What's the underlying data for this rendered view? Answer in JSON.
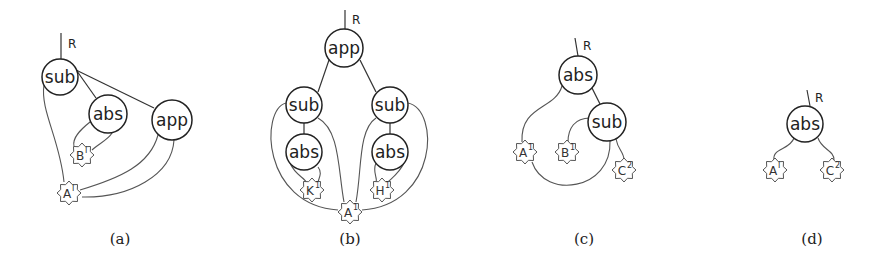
{
  "figure": {
    "captions": [
      "(a)",
      "(b)",
      "(c)",
      "(d)"
    ],
    "caption_x": [
      120,
      350,
      584,
      812
    ],
    "root_label": "R",
    "panels": [
      {
        "id": "a",
        "root": {
          "x1": 61,
          "y1": 33,
          "x2": 61,
          "y2": 59,
          "label_x": 68,
          "label_y": 48
        },
        "nodes": [
          {
            "id": "sub",
            "label": "sub",
            "x": 60,
            "y": 77,
            "r": 18
          },
          {
            "id": "abs",
            "label": "abs",
            "x": 108,
            "y": 114,
            "r": 19
          },
          {
            "id": "app",
            "label": "app",
            "x": 172,
            "y": 120,
            "r": 20
          }
        ],
        "stars": [
          {
            "id": "B",
            "label": "B",
            "sup": "I",
            "x": 82,
            "y": 155
          },
          {
            "id": "A",
            "label": "A",
            "sup": "I",
            "x": 69,
            "y": 193
          }
        ],
        "edges": [
          {
            "d": "M72 64 L96 98"
          },
          {
            "d": "M76 70 L154 108"
          }
        ],
        "wires": [
          {
            "d": "M44 85 C40 110, 60 140, 64 182"
          },
          {
            "d": "M90 122 C80 130, 72 138, 74 146"
          },
          {
            "d": "M112 133 C108 140, 98 144, 92 150"
          },
          {
            "d": "M158 135 C150 165, 120 178, 80 190"
          },
          {
            "d": "M174 140 C172 175, 130 198, 82 197"
          }
        ]
      },
      {
        "id": "b",
        "root": {
          "x1": 345,
          "y1": 10,
          "x2": 345,
          "y2": 30,
          "label_x": 352,
          "label_y": 24
        },
        "nodes": [
          {
            "id": "app",
            "label": "app",
            "x": 344,
            "y": 48,
            "r": 19
          },
          {
            "id": "sub-left",
            "label": "sub",
            "x": 304,
            "y": 105,
            "r": 18
          },
          {
            "id": "sub-right",
            "label": "sub",
            "x": 390,
            "y": 105,
            "r": 18
          },
          {
            "id": "abs-left",
            "label": "abs",
            "x": 304,
            "y": 152,
            "r": 18
          },
          {
            "id": "abs-right",
            "label": "abs",
            "x": 390,
            "y": 152,
            "r": 18
          }
        ],
        "stars": [
          {
            "id": "K",
            "label": "K",
            "sup": "1",
            "x": 312,
            "y": 190
          },
          {
            "id": "H",
            "label": "H",
            "sup": "1",
            "x": 382,
            "y": 190
          },
          {
            "id": "A",
            "label": "A",
            "sup": "1",
            "x": 350,
            "y": 212
          }
        ],
        "edges": [
          {
            "d": "M329 60 L318 92"
          },
          {
            "d": "M360 60 L376 92"
          },
          {
            "d": "M304 123 L304 134"
          },
          {
            "d": "M390 123 L390 134"
          }
        ],
        "wires": [
          {
            "d": "M286 103 C260 110, 262 205, 338 210"
          },
          {
            "d": "M318 118 C340 130, 338 170, 344 202"
          },
          {
            "d": "M376 118 C358 130, 362 170, 356 202"
          },
          {
            "d": "M408 103 C440 110, 438 205, 362 210"
          },
          {
            "d": "M290 163 C295 175, 305 178, 306 182"
          },
          {
            "d": "M318 167 C322 172, 320 176, 318 182"
          },
          {
            "d": "M376 163 C372 172, 378 178, 376 182"
          },
          {
            "d": "M404 163 C400 172, 392 178, 388 182"
          }
        ]
      },
      {
        "id": "c",
        "root": {
          "x1": 575,
          "y1": 38,
          "x2": 578,
          "y2": 56,
          "label_x": 583,
          "label_y": 50
        },
        "nodes": [
          {
            "id": "abs",
            "label": "abs",
            "x": 578,
            "y": 75,
            "r": 19
          },
          {
            "id": "sub",
            "label": "sub",
            "x": 607,
            "y": 122,
            "r": 19
          }
        ],
        "stars": [
          {
            "id": "A",
            "label": "A",
            "sup": "1",
            "x": 525,
            "y": 152
          },
          {
            "id": "B",
            "label": "B",
            "sup": "1",
            "x": 567,
            "y": 152
          },
          {
            "id": "C",
            "label": "C",
            "sup": "2",
            "x": 624,
            "y": 170
          }
        ],
        "edges": [
          {
            "d": "M592 88 L600 104"
          }
        ],
        "wires": [
          {
            "d": "M562 86 C555 110, 520 105, 522 142"
          },
          {
            "d": "M590 118 C575 118, 568 128, 568 142"
          },
          {
            "d": "M610 141 C612 190, 545 200, 532 162"
          },
          {
            "d": "M616 139 C618 150, 624 152, 624 160"
          }
        ]
      },
      {
        "id": "d",
        "root": {
          "x1": 807,
          "y1": 90,
          "x2": 810,
          "y2": 106,
          "label_x": 815,
          "label_y": 102
        },
        "nodes": [
          {
            "id": "abs",
            "label": "abs",
            "x": 805,
            "y": 124,
            "r": 18
          }
        ],
        "stars": [
          {
            "id": "A",
            "label": "A",
            "sup": "I",
            "x": 775,
            "y": 170
          },
          {
            "id": "C",
            "label": "C",
            "sup": "2",
            "x": 832,
            "y": 170
          }
        ],
        "edges": [],
        "wires": [
          {
            "d": "M794 138 C790 150, 772 148, 774 160"
          },
          {
            "d": "M818 138 C822 150, 834 150, 834 160"
          }
        ]
      }
    ]
  }
}
